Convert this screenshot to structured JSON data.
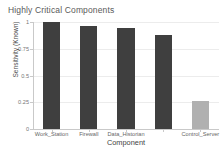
{
  "chart_data": {
    "type": "bar",
    "title": "Highly Critical Components",
    "xlabel": "Component",
    "ylabel": "Sensitivity (Known)",
    "categories": [
      "Work_Station",
      "Firewall",
      "Data_Historian",
      "",
      "Control_Server"
    ],
    "values": [
      1.0,
      0.96,
      0.94,
      0.88,
      0.26
    ],
    "bar_colors": [
      "#3f3f3f",
      "#3f3f3f",
      "#3f3f3f",
      "#3f3f3f",
      "#b0b0b0"
    ],
    "ylim": [
      0,
      1
    ],
    "ytick_labels": [
      "0",
      "0.25",
      "0.5",
      "0.75",
      "1"
    ],
    "ytick_values": [
      0,
      0.25,
      0.5,
      0.75,
      1
    ],
    "grid": true,
    "legend": null
  },
  "style": {
    "background": "#ffffff",
    "title_color": "#5a5a5a",
    "axis_color": "#c9c9c9",
    "grid_color": "#ececec",
    "tick_label_color": "#777777",
    "primary_bar_color": "#3f3f3f",
    "secondary_bar_color": "#b0b0b0"
  }
}
